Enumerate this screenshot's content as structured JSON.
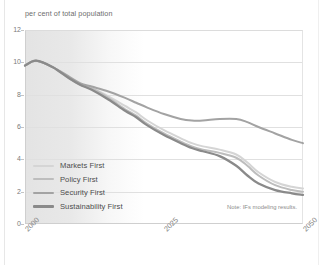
{
  "chart_data": {
    "type": "line",
    "title": "",
    "subtitle": "",
    "ylabel": "per cent of total population",
    "xlabel": "",
    "ylim": [
      0,
      12
    ],
    "xlim": [
      2000,
      2050
    ],
    "yticks": [
      "12",
      "10",
      "8",
      "6",
      "4",
      "2",
      "0"
    ],
    "ytick_values": [
      12,
      10,
      8,
      6,
      4,
      2,
      0
    ],
    "xticks": [
      "2000",
      "2025",
      "2050"
    ],
    "xtick_values": [
      2000,
      2025,
      2050
    ],
    "grid": "horizontal",
    "legend_position": "inside-lower-left",
    "shaded_region": {
      "label": "history",
      "from": 2000,
      "to": 2012,
      "fade": "right"
    },
    "annotation": "Note: IFs modeling results.",
    "x": [
      2000,
      2002,
      2005,
      2008,
      2010,
      2012,
      2015,
      2018,
      2020,
      2022,
      2025,
      2028,
      2030,
      2032,
      2035,
      2038,
      2040,
      2042,
      2045,
      2048,
      2050
    ],
    "series": [
      {
        "name": "Markets First",
        "color": "#d5d5d5",
        "values": [
          9.8,
          10.1,
          9.7,
          9.0,
          8.6,
          8.4,
          7.9,
          7.3,
          6.9,
          6.4,
          5.8,
          5.3,
          5.0,
          4.8,
          4.6,
          4.3,
          3.8,
          3.2,
          2.6,
          2.3,
          2.2
        ]
      },
      {
        "name": "Policy First",
        "color": "#bdbdbd",
        "values": [
          9.8,
          10.1,
          9.7,
          9.0,
          8.6,
          8.4,
          7.8,
          7.1,
          6.7,
          6.2,
          5.6,
          5.1,
          4.8,
          4.6,
          4.4,
          4.1,
          3.6,
          3.0,
          2.4,
          2.1,
          2.0
        ]
      },
      {
        "name": "Security First",
        "color": "#a3a3a3",
        "values": [
          9.8,
          10.1,
          9.7,
          9.1,
          8.7,
          8.5,
          8.2,
          7.8,
          7.5,
          7.2,
          6.8,
          6.5,
          6.4,
          6.4,
          6.5,
          6.5,
          6.3,
          6.0,
          5.6,
          5.2,
          5.0
        ]
      },
      {
        "name": "Sustainability First",
        "color": "#8a8a8a",
        "values": [
          9.8,
          10.1,
          9.7,
          9.0,
          8.6,
          8.3,
          7.7,
          7.0,
          6.6,
          6.1,
          5.5,
          5.0,
          4.7,
          4.5,
          4.2,
          3.6,
          3.0,
          2.5,
          2.1,
          1.9,
          1.8
        ]
      }
    ]
  },
  "colors": {
    "gridline": "#e0e0e0",
    "frame": "#cfcfcf",
    "tick_text": "#7a7a7a",
    "title_text": "#6c6c6c",
    "legend_text": "#4c4c4c",
    "note_text": "#8c8c8c",
    "band": "#e2e2e2"
  }
}
